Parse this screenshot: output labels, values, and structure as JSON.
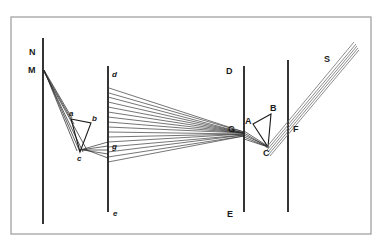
{
  "figure": {
    "background_color": "#ffffff",
    "ink_color": "#1a1a1a",
    "frame_color": "#9a9a9a",
    "ray_color": "#2b2b2b",
    "beam_color": "#707070"
  },
  "frame": {
    "x": 11,
    "y": 17,
    "width": 360,
    "height": 217
  },
  "labels": {
    "N": "N",
    "M": "M",
    "a": "a",
    "b": "b",
    "c": "c",
    "d": "d",
    "e": "e",
    "g": "g",
    "D": "D",
    "E": "E",
    "G": "G",
    "A": "A",
    "B": "B",
    "C": "C",
    "F": "F",
    "S": "S"
  },
  "label_positions": [
    {
      "name": "label-N",
      "text": "N",
      "x": 29,
      "y": 55,
      "style": "upper"
    },
    {
      "name": "label-M",
      "text": "M",
      "x": 28,
      "y": 73,
      "style": "upper"
    },
    {
      "name": "label-a",
      "text": "a",
      "x": 71,
      "y": 116,
      "style": "lower"
    },
    {
      "name": "label-b",
      "text": "b",
      "x": 92,
      "y": 121,
      "style": "lower"
    },
    {
      "name": "label-c",
      "text": "c",
      "x": 78,
      "y": 158,
      "style": "lower"
    },
    {
      "name": "label-d",
      "text": "d",
      "x": 113,
      "y": 76,
      "style": "lower"
    },
    {
      "name": "label-e",
      "text": "e",
      "x": 114,
      "y": 215,
      "style": "lower"
    },
    {
      "name": "label-g",
      "text": "g",
      "x": 113,
      "y": 146,
      "style": "lower"
    },
    {
      "name": "label-D",
      "text": "D",
      "x": 227,
      "y": 73,
      "style": "upper"
    },
    {
      "name": "label-E",
      "text": "E",
      "x": 228,
      "y": 216,
      "style": "upper"
    },
    {
      "name": "label-G",
      "text": "G",
      "x": 229,
      "y": 131,
      "style": "upper"
    },
    {
      "name": "label-A",
      "text": "A",
      "x": 247,
      "y": 123,
      "style": "upper"
    },
    {
      "name": "label-B",
      "text": "B",
      "x": 271,
      "y": 110,
      "style": "upper"
    },
    {
      "name": "label-C",
      "text": "C",
      "x": 264,
      "y": 153,
      "style": "upper"
    },
    {
      "name": "label-F",
      "text": "F",
      "x": 295,
      "y": 131,
      "style": "upper"
    },
    {
      "name": "label-S",
      "text": "S",
      "x": 325,
      "y": 61,
      "style": "upper"
    }
  ],
  "vertical_lines": [
    {
      "name": "screen-line-NM",
      "x": 43,
      "y1": 38,
      "y2": 224
    },
    {
      "name": "screen-line-de",
      "x": 108,
      "y1": 66,
      "y2": 212
    },
    {
      "name": "screen-line-DE",
      "x": 244,
      "y1": 66,
      "y2": 212
    },
    {
      "name": "screen-line-F",
      "x": 288,
      "y1": 60,
      "y2": 212
    }
  ],
  "prism_left": {
    "name": "prism-abc",
    "vertices": [
      [
        71,
        119
      ],
      [
        91,
        123
      ],
      [
        80,
        152
      ]
    ]
  },
  "prism_right": {
    "name": "prism-ABC",
    "vertices": [
      [
        253,
        124
      ],
      [
        271,
        114
      ],
      [
        268,
        147
      ]
    ]
  },
  "converge_point": {
    "x": 244,
    "y": 133
  },
  "source_point": {
    "x": 44,
    "y": 71
  },
  "fan_left": {
    "name": "ray-bundle-M-to-prism",
    "count": 4,
    "from_x": 44,
    "from_y": 70,
    "to_x": 78,
    "to_y": 150,
    "spread": 4
  },
  "fan_center": {
    "name": "ray-bundle-fan-to-G",
    "count": 13,
    "apex_x": 244,
    "apex_y": 133,
    "line_x": 108,
    "top_y": 97,
    "bottom_y": 162
  },
  "beam_out": {
    "name": "output-beam-S",
    "x1": 266,
    "y1": 146,
    "x2": 356,
    "y2": 44,
    "stripes": 5
  }
}
